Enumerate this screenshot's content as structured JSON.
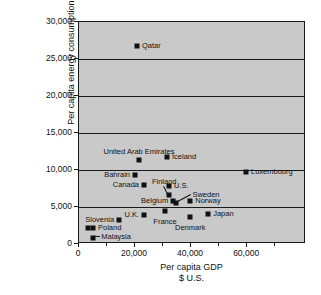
{
  "chart_data": {
    "type": "scatter",
    "title": "",
    "xlabel": "Per capita GDP",
    "xlabel_line2": "$ U.S.",
    "ylabel": "Per capita energy consumption",
    "ylabel_line2": "(kg oil equivalent)",
    "xlim": [
      0,
      81000
    ],
    "ylim": [
      0,
      30000
    ],
    "xticks": [
      0,
      20000,
      40000,
      60000
    ],
    "xtick_labels": [
      "0",
      "20,000",
      "40,000",
      "60,000"
    ],
    "yticks": [
      0,
      5000,
      10000,
      15000,
      20000,
      25000,
      30000
    ],
    "ytick_labels": [
      "0",
      "5,000",
      "10,000",
      "15,000",
      "20,000",
      "25,000",
      "30,000"
    ],
    "grid": true,
    "grid_axis": "y",
    "legend": false,
    "marker_color": "#111111",
    "plot_background": "#c9c9c9",
    "points": [
      {
        "name": "Qatar",
        "x": 20700,
        "y": 26800,
        "label_pos": "right"
      },
      {
        "name": "United Arab Emirates",
        "x": 21400,
        "y": 11300,
        "label_pos": "above"
      },
      {
        "name": "Iceland",
        "x": 31400,
        "y": 11700,
        "label_pos": "right"
      },
      {
        "name": "Luxembourg",
        "x": 59600,
        "y": 9700,
        "label_pos": "right"
      },
      {
        "name": "Bahrain",
        "x": 20000,
        "y": 9300,
        "label_pos": "left"
      },
      {
        "name": "Canada",
        "x": 23200,
        "y": 8000,
        "label_pos": "left"
      },
      {
        "name": "U.S.",
        "x": 32100,
        "y": 7900,
        "label_pos": "right"
      },
      {
        "name": "Finland",
        "x": 32100,
        "y": 6600,
        "label_pos": "leader"
      },
      {
        "name": "Belgium",
        "x": 33600,
        "y": 5800,
        "label_pos": "left"
      },
      {
        "name": "Sweden",
        "x": 34600,
        "y": 5500,
        "label_pos": "leader"
      },
      {
        "name": "Norway",
        "x": 39700,
        "y": 5800,
        "label_pos": "right"
      },
      {
        "name": "France",
        "x": 30700,
        "y": 4400,
        "label_pos": "below"
      },
      {
        "name": "U.K.",
        "x": 23200,
        "y": 3900,
        "label_pos": "left"
      },
      {
        "name": "Japan",
        "x": 46100,
        "y": 4000,
        "label_pos": "right"
      },
      {
        "name": "Denmark",
        "x": 39700,
        "y": 3600,
        "label_pos": "below"
      },
      {
        "name": "Slovenia",
        "x": 14300,
        "y": 3300,
        "label_pos": "left"
      },
      {
        "name": "Poland",
        "x": 5000,
        "y": 2200,
        "label_pos": "right"
      },
      {
        "name": "Poland-2",
        "x": 3200,
        "y": 2200,
        "label_pos": "none"
      },
      {
        "name": "Malaysia",
        "x": 5000,
        "y": 850,
        "label_pos": "leader"
      }
    ],
    "leader_lines": [
      {
        "name": "finland-leader",
        "from_x": 30400,
        "from_y": 7900,
        "to_x": 32100,
        "to_y": 6600
      },
      {
        "name": "sweden-leader",
        "from_x": 40100,
        "from_y": 6600,
        "to_x": 34600,
        "to_y": 5500
      },
      {
        "name": "malaysia-leader",
        "from_x": 7600,
        "from_y": 950,
        "to_x": 5300,
        "to_y": 1000
      }
    ]
  }
}
